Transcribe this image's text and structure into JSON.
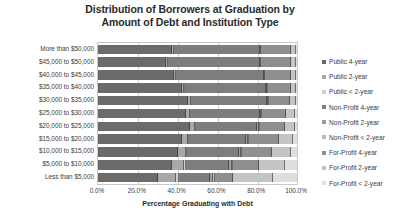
{
  "chart": {
    "title_line1": "Distribution of Borrowers at Graduation by",
    "title_line2": "Amount of Debt and Institution Type",
    "xlabel": "Percentage Graduating with Debt"
  },
  "chart_data": {
    "type": "bar",
    "orientation": "horizontal",
    "stacked": true,
    "normalized": true,
    "title": "Distribution of Borrowers at Graduation by Amount of Debt and Institution Type",
    "xlabel": "Percentage Graduating with Debt",
    "ylabel": "",
    "xlim": [
      0,
      100
    ],
    "xticks": [
      0,
      20,
      40,
      60,
      80,
      100
    ],
    "xticklabels": [
      "0.0%",
      "20.0%",
      "40.0%",
      "60.0%",
      "80.0%",
      "100.0%"
    ],
    "grid": true,
    "legend_position": "right",
    "categories": [
      "More than $50,000",
      "$45,000 to $50,000",
      "$40,000 to $45,000",
      "$35,000 to $40,000",
      "$30,000 to $35,000",
      "$25,000 to $30,000",
      "$20,000 to $25,000",
      "$15,000 to $20,000",
      "$10,000 to $15,000",
      "$5,000 to $10,000",
      "Less than $5,000"
    ],
    "series": [
      {
        "name": "Public 4-year",
        "color": "#6b6b6b",
        "values": [
          37.0,
          34.0,
          38.0,
          42.0,
          45.0,
          44.0,
          46.0,
          42.0,
          40.0,
          37.0,
          30.0
        ]
      },
      {
        "name": "Public 2-year",
        "color": "#a8a8a8",
        "values": [
          1.0,
          1.0,
          1.0,
          1.2,
          1.5,
          2.0,
          2.5,
          3.0,
          4.0,
          6.0,
          9.0
        ]
      },
      {
        "name": "Public < 2-year",
        "color": "#cfcfcf",
        "values": [
          0.3,
          0.3,
          0.3,
          0.3,
          0.4,
          0.4,
          0.5,
          0.6,
          0.8,
          1.0,
          1.5
        ]
      },
      {
        "name": "Non-Profit 4-year",
        "color": "#7d7d7d",
        "values": [
          43.0,
          46.0,
          44.0,
          41.0,
          38.0,
          35.0,
          31.0,
          29.0,
          26.0,
          22.0,
          16.0
        ]
      },
      {
        "name": "Non-Profit 2-year",
        "color": "#9c9c9c",
        "values": [
          0.5,
          0.5,
          0.5,
          0.5,
          0.6,
          0.7,
          0.8,
          0.9,
          1.0,
          1.2,
          1.5
        ]
      },
      {
        "name": "Non-Profit < 2-year",
        "color": "#bdbdbd",
        "values": [
          0.2,
          0.2,
          0.2,
          0.3,
          0.3,
          0.4,
          0.4,
          0.5,
          0.6,
          0.8,
          1.0
        ]
      },
      {
        "name": "For-Profit 4-year",
        "color": "#8f8f8f",
        "values": [
          15.0,
          15.0,
          13.0,
          11.5,
          10.5,
          12.0,
          13.0,
          15.0,
          15.0,
          13.0,
          9.0
        ]
      },
      {
        "name": "For-Profit 2-year",
        "color": "#c4c4c4",
        "values": [
          2.5,
          2.5,
          2.5,
          2.8,
          3.2,
          4.5,
          5.0,
          7.0,
          9.5,
          13.0,
          20.0
        ]
      },
      {
        "name": "For-Profit < 2-year",
        "color": "#dedede",
        "values": [
          0.5,
          0.5,
          0.5,
          0.4,
          0.5,
          1.0,
          0.8,
          2.0,
          3.1,
          6.0,
          12.0
        ]
      }
    ]
  }
}
